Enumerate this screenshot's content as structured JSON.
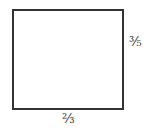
{
  "diagram": {
    "shape": "rectangle",
    "width_label": "⅔",
    "height_label": "⅗",
    "stroke_color": "#333333"
  }
}
